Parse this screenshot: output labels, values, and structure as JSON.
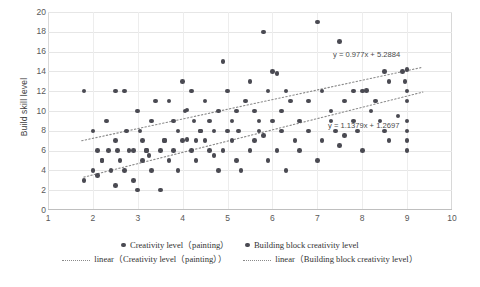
{
  "chart_data": {
    "type": "scatter",
    "title": "",
    "xlabel": "",
    "ylabel": "Build skill level",
    "xlim": [
      1,
      10
    ],
    "ylim": [
      0,
      20
    ],
    "grid": true,
    "x_ticks": [
      "1",
      "2",
      "3",
      "4",
      "5",
      "6",
      "7",
      "8",
      "9",
      "10"
    ],
    "y_ticks": [
      "0",
      "2",
      "4",
      "6",
      "8",
      "10",
      "12",
      "14",
      "16",
      "18",
      "20"
    ],
    "legend_position": "bottom",
    "marker_color": "#4a4a52",
    "trendline_color": "#8a8a8a",
    "annotations": [
      {
        "text": "y = 0.977x + 5.2884",
        "x": 8.45,
        "y": 15.1
      },
      {
        "text": "y = 1.1379x + 1.2697",
        "x": 8.35,
        "y": 8.2
      }
    ],
    "series": [
      {
        "name": "Creativity level（painting）",
        "marker": "circle",
        "points": [
          [
            1.8,
            12.0
          ],
          [
            2.0,
            8.0
          ],
          [
            2.1,
            6.0
          ],
          [
            2.2,
            5.0
          ],
          [
            2.3,
            9.0
          ],
          [
            2.35,
            6.0
          ],
          [
            2.5,
            12.0
          ],
          [
            2.5,
            7.0
          ],
          [
            2.55,
            6.0
          ],
          [
            2.7,
            12.0
          ],
          [
            2.75,
            8.0
          ],
          [
            2.9,
            6.0
          ],
          [
            3.0,
            10.0
          ],
          [
            3.05,
            8.0
          ],
          [
            3.1,
            7.0
          ],
          [
            3.2,
            6.0
          ],
          [
            3.3,
            9.0
          ],
          [
            3.4,
            11.0
          ],
          [
            3.5,
            6.0
          ],
          [
            3.6,
            7.0
          ],
          [
            3.7,
            11.0
          ],
          [
            3.8,
            9.0
          ],
          [
            3.9,
            8.0
          ],
          [
            4.0,
            13.0
          ],
          [
            4.05,
            10.0
          ],
          [
            4.1,
            10.1
          ],
          [
            4.2,
            12.0
          ],
          [
            4.25,
            9.0
          ],
          [
            4.3,
            7.0
          ],
          [
            4.4,
            8.0
          ],
          [
            4.5,
            11.0
          ],
          [
            4.6,
            9.0
          ],
          [
            4.7,
            8.0
          ],
          [
            4.8,
            10.0
          ],
          [
            4.9,
            15.0
          ],
          [
            5.0,
            12.0
          ],
          [
            5.1,
            9.0
          ],
          [
            5.2,
            10.0
          ],
          [
            5.25,
            8.0
          ],
          [
            5.4,
            11.0
          ],
          [
            5.5,
            13.0
          ],
          [
            5.6,
            10.0
          ],
          [
            5.7,
            9.0
          ],
          [
            5.8,
            18.0
          ],
          [
            5.9,
            12.0
          ],
          [
            6.0,
            14.0
          ],
          [
            6.1,
            13.8
          ],
          [
            6.2,
            10.0
          ],
          [
            6.3,
            12.0
          ],
          [
            6.4,
            11.0
          ],
          [
            6.6,
            9.0
          ],
          [
            6.8,
            11.0
          ],
          [
            7.0,
            19.0
          ],
          [
            7.1,
            12.0
          ],
          [
            7.3,
            10.0
          ],
          [
            7.5,
            17.0
          ],
          [
            7.6,
            11.0
          ],
          [
            7.8,
            12.0
          ],
          [
            8.0,
            12.0
          ],
          [
            8.1,
            12.1
          ],
          [
            8.3,
            11.0
          ],
          [
            8.5,
            14.0
          ],
          [
            8.6,
            13.0
          ],
          [
            8.9,
            14.0
          ],
          [
            8.95,
            13.0
          ],
          [
            9.0,
            12.0
          ],
          [
            9.0,
            11.0
          ],
          [
            9.0,
            14.2
          ]
        ]
      },
      {
        "name": "Building block creativity level",
        "marker": "circle",
        "points": [
          [
            1.8,
            3.0
          ],
          [
            2.0,
            4.0
          ],
          [
            2.1,
            3.5
          ],
          [
            2.2,
            5.0
          ],
          [
            2.4,
            4.0
          ],
          [
            2.5,
            2.5
          ],
          [
            2.6,
            5.0
          ],
          [
            2.7,
            4.0
          ],
          [
            2.8,
            6.0
          ],
          [
            2.9,
            3.0
          ],
          [
            3.0,
            2.0
          ],
          [
            3.1,
            5.0
          ],
          [
            3.2,
            6.0
          ],
          [
            3.25,
            5.5
          ],
          [
            3.3,
            4.0
          ],
          [
            3.5,
            2.0
          ],
          [
            3.6,
            7.0
          ],
          [
            3.7,
            5.0
          ],
          [
            3.8,
            6.0
          ],
          [
            3.9,
            4.0
          ],
          [
            4.0,
            7.0
          ],
          [
            4.1,
            7.1
          ],
          [
            4.2,
            6.0
          ],
          [
            4.3,
            5.0
          ],
          [
            4.4,
            8.0
          ],
          [
            4.5,
            7.0
          ],
          [
            4.6,
            6.0
          ],
          [
            4.7,
            5.5
          ],
          [
            4.8,
            4.0
          ],
          [
            4.9,
            6.0
          ],
          [
            5.0,
            8.0
          ],
          [
            5.1,
            7.0
          ],
          [
            5.2,
            5.0
          ],
          [
            5.3,
            4.0
          ],
          [
            5.5,
            6.0
          ],
          [
            5.6,
            7.0
          ],
          [
            5.7,
            8.0
          ],
          [
            5.8,
            7.5
          ],
          [
            5.9,
            5.0
          ],
          [
            6.0,
            9.0
          ],
          [
            6.1,
            6.0
          ],
          [
            6.2,
            8.0
          ],
          [
            6.3,
            4.0
          ],
          [
            6.5,
            7.0
          ],
          [
            6.6,
            6.0
          ],
          [
            6.8,
            8.0
          ],
          [
            7.0,
            5.0
          ],
          [
            7.1,
            7.0
          ],
          [
            7.3,
            9.0
          ],
          [
            7.4,
            8.0
          ],
          [
            7.5,
            6.5
          ],
          [
            7.6,
            7.5
          ],
          [
            7.8,
            9.0
          ],
          [
            7.9,
            8.0
          ],
          [
            8.0,
            6.0
          ],
          [
            8.2,
            10.0
          ],
          [
            8.4,
            9.0
          ],
          [
            8.5,
            8.0
          ],
          [
            8.6,
            7.0
          ],
          [
            8.8,
            9.5
          ],
          [
            9.0,
            9.0
          ],
          [
            9.0,
            8.0
          ],
          [
            9.0,
            7.0
          ],
          [
            9.0,
            6.0
          ]
        ]
      }
    ],
    "trendlines": [
      {
        "name": "linear（Creativity level（painting））",
        "slope": 0.977,
        "intercept": 5.2884,
        "equation": "y = 0.977x + 5.2884"
      },
      {
        "name": "linear（Building block creativity level）",
        "slope": 1.1379,
        "intercept": 1.2697,
        "equation": "y = 1.1379x + 1.2697"
      }
    ]
  },
  "legend": {
    "row1": [
      {
        "label": "Creativity level（painting）",
        "marker": "dot"
      },
      {
        "label": "Building block creativity level",
        "marker": "dot"
      }
    ],
    "row2": [
      {
        "label": "linear（Creativity level（painting））",
        "marker": "dotted-line"
      },
      {
        "label": "linear（Building block creativity level）",
        "marker": "dotted-line"
      }
    ]
  }
}
